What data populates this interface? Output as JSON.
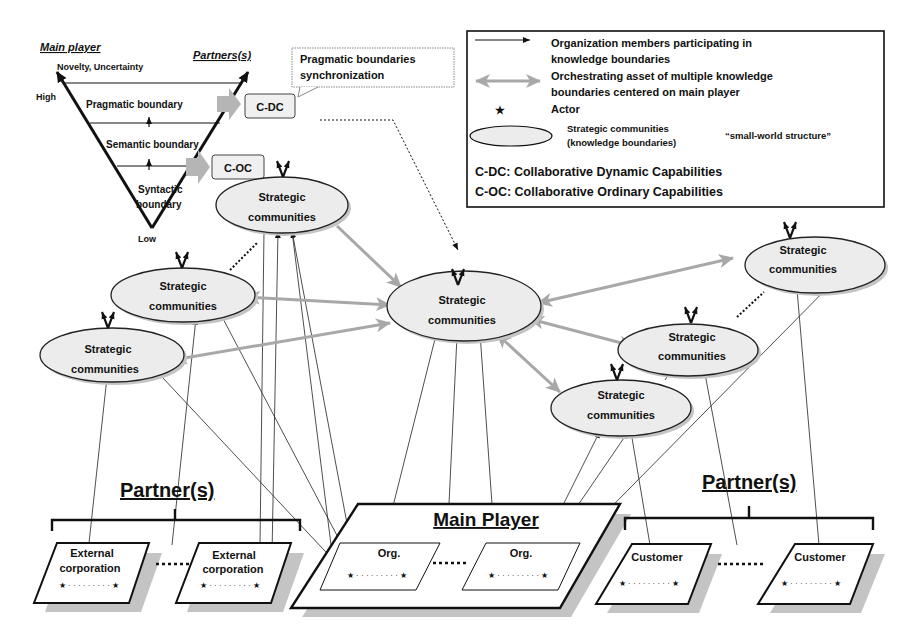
{
  "triangle": {
    "left_label": "Main player",
    "right_label": "Partners(s)",
    "top_label": "Novelty, Uncertainty",
    "high_label": "High",
    "low_label": "Low",
    "levels": [
      "Pragmatic boundary",
      "Semantic boundary",
      "Syntactic",
      "boundary"
    ]
  },
  "capability_boxes": {
    "cdc": "C-DC",
    "coc": "C-OC"
  },
  "callout": {
    "line1": "Pragmatic boundaries",
    "line2": "synchronization"
  },
  "legend": {
    "arrow_line1": "Organization members participating in",
    "arrow_line2": "knowledge boundaries",
    "double_arrow_line1": "Orchestrating asset of multiple knowledge",
    "double_arrow_line2": "boundaries centered on main player",
    "star_label": "Actor",
    "star_glyph": "★",
    "ellipse_line1": "Strategic communities",
    "ellipse_line2": "(knowledge boundaries)",
    "small_world": "“small-world structure”",
    "cdc_def": "C-DC: Collaborative Dynamic Capabilities",
    "coc_def": "C-OC: Collaborative Ordinary Capabilities"
  },
  "communities": [
    {
      "line1": "Strategic",
      "line2": "communities"
    },
    {
      "line1": "Strategic",
      "line2": "communities"
    },
    {
      "line1": "Strategic",
      "line2": "communities"
    },
    {
      "line1": "Strategic",
      "line2": "communities"
    },
    {
      "line1": "Strategic",
      "line2": "communities"
    },
    {
      "line1": "Strategic",
      "line2": "communities"
    },
    {
      "line1": "Strategic",
      "line2": "communities"
    }
  ],
  "bottom": {
    "partners_left_label": "Partner(s)",
    "partners_right_label": "Partner(s)",
    "main_player_label": "Main Player",
    "external_1_line1": "External",
    "external_1_line2": "corporation",
    "external_2_line1": "External",
    "external_2_line1b": "External",
    "external_2_line2": "corporation",
    "org_1": "Org.",
    "org_2": "Org.",
    "customer_1": "Customer",
    "customer_2": "Customer",
    "actors": "★ · · · · · · · · · ★"
  },
  "colors": {
    "ellipse_fill": "#ececec",
    "orchestrating_arrow": "#a8a8a8",
    "capability_arrow": "#b5b5b5",
    "shadow": "#c4c4c4",
    "line": "#111111"
  }
}
